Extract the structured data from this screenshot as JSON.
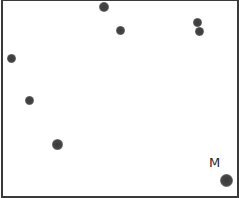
{
  "figure": {
    "type": "chromatography-plate",
    "border_color": "#3a3a3a",
    "background": "#ffffff",
    "spot_color": "#444444",
    "marker_label": "M",
    "spots": [
      {
        "id": "spot-1",
        "x": 104,
        "y": 7,
        "d": 10
      },
      {
        "id": "spot-2",
        "x": 120,
        "y": 30,
        "d": 9
      },
      {
        "id": "spot-3",
        "x": 197,
        "y": 22,
        "d": 9
      },
      {
        "id": "spot-4",
        "x": 199,
        "y": 31,
        "d": 9
      },
      {
        "id": "spot-5",
        "x": 11,
        "y": 58,
        "d": 9
      },
      {
        "id": "spot-6",
        "x": 29,
        "y": 100,
        "d": 9
      },
      {
        "id": "spot-7",
        "x": 57,
        "y": 144,
        "d": 11
      },
      {
        "id": "marker-spot",
        "x": 226,
        "y": 180,
        "d": 13
      }
    ]
  }
}
